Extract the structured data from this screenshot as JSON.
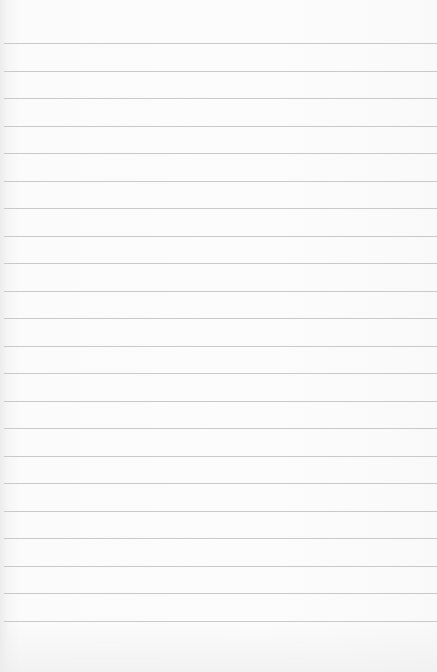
{
  "paper": {
    "type": "lined-paper",
    "background_color": "#fbfbfb",
    "line_color": "#c9c9c9",
    "line_count": 22,
    "first_line_y": 43,
    "line_spacing": 27.5,
    "text": ""
  }
}
